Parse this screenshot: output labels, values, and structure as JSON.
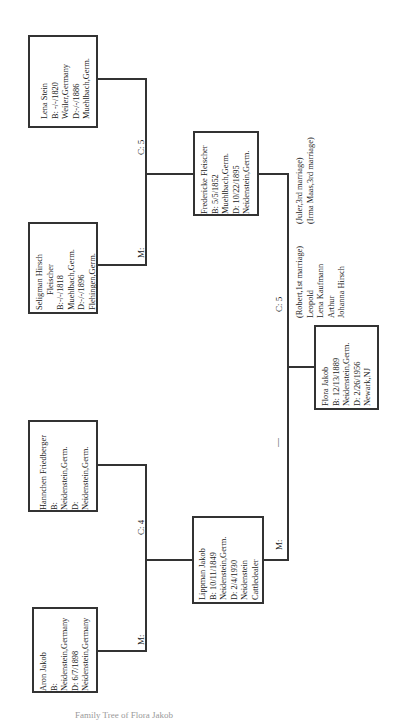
{
  "caption": "Family Tree of Flora Jakob",
  "persons": {
    "lena_stein": {
      "lines": [
        "Lena Stein",
        "B: -/-/1820",
        "Weiler,Germany",
        "D:-/-/1886",
        "Muehlbach,Germ."
      ]
    },
    "seligman": {
      "lines": [
        "Seligman Hirsch",
        "Fleischer",
        "B:-/-/1818",
        "Muehlbach,Germ.",
        "D:-/-/1896",
        "Flehingen,Germ."
      ]
    },
    "hannchen": {
      "lines": [
        "Hannchen Friedberger",
        "B:",
        "Neidenstein,Germ.",
        "D:",
        "Neidenstein,Germ."
      ]
    },
    "aron": {
      "lines": [
        "Aron Jakob",
        "B:",
        "Neidenstein,Germany",
        "D: 6/7/1898",
        "Neidenstein,Germany"
      ]
    },
    "fredericke": {
      "lines": [
        "Fredericke Fleischer",
        "B: 5/5/1852",
        "Muehlbach,Germ.",
        "D: 10/22/1895",
        "Neidenstein,Germ."
      ]
    },
    "lippman": {
      "lines": [
        "Lippman Jakob",
        "B: 10/11/1849",
        "Neidenstein,Germ.",
        "D: 2/4/1930",
        "Neidenstein",
        "Cattledealer"
      ]
    },
    "flora": {
      "lines": [
        "Flora Jakob",
        "B: 12/13/1889",
        "Neidenstein,Germ.",
        "D: 2/26/1956",
        "Newark,NJ"
      ]
    }
  },
  "connectors": {
    "upper_marriage": "M:",
    "upper_children": "C: 5",
    "lower_marriage": "M:",
    "lower_children": "C: 4",
    "main_marriage": "M:",
    "main_dash": "—",
    "main_children": "C: 5"
  },
  "siblings": {
    "col1": [
      "(Robert,1st marriage)",
      "Leopold",
      "Lena Kaufmann",
      "Arthur",
      "Johanna Hirsch"
    ],
    "col2": [
      "(Juler,3rd marriage)",
      "(Irma Maas,3rd marriage)"
    ]
  }
}
